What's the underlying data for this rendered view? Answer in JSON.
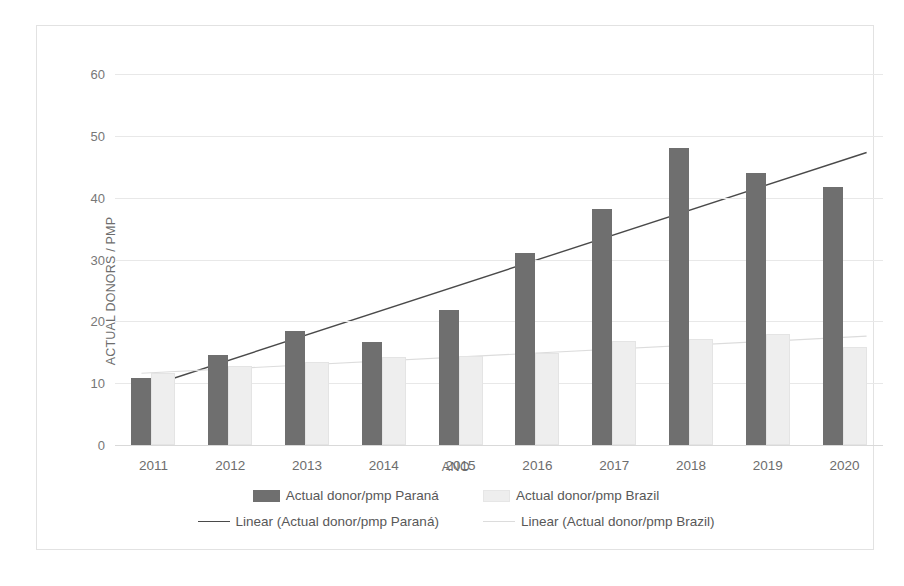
{
  "chart_data": {
    "type": "bar",
    "title": "",
    "xlabel": "ANO",
    "ylabel": "ACTUAL DONORS / PMP",
    "categories": [
      "2011",
      "2012",
      "2013",
      "2014",
      "2015",
      "2016",
      "2017",
      "2018",
      "2019",
      "2020"
    ],
    "ylim": [
      0,
      60
    ],
    "yticks": [
      0,
      10,
      20,
      30,
      40,
      50,
      60
    ],
    "grid": true,
    "legend_position": "bottom",
    "series": [
      {
        "name": "Actual donor/pmp Paraná",
        "type": "bar",
        "color": "#6f6f6f",
        "values": [
          10.8,
          14.6,
          18.4,
          16.7,
          21.8,
          31.0,
          38.2,
          48.0,
          44.0,
          41.7
        ]
      },
      {
        "name": "Actual donor/pmp Brazil",
        "type": "bar",
        "color": "#eeeeee",
        "values": [
          11.6,
          12.7,
          13.4,
          14.3,
          14.4,
          14.9,
          16.8,
          17.1,
          17.9,
          15.9
        ]
      },
      {
        "name": "Linear (Actual donor/pmp Paraná)",
        "type": "trendline",
        "color": "#4a4a4a",
        "start": 9.1,
        "end": 47.3
      },
      {
        "name": "Linear (Actual donor/pmp Brazil)",
        "type": "trendline",
        "color": "#dcdcdc",
        "start": 11.6,
        "end": 17.6
      }
    ],
    "legend": [
      {
        "label": "Actual donor/pmp Paraná",
        "marker": "bar-swatch-dark"
      },
      {
        "label": "Actual donor/pmp Brazil",
        "marker": "bar-swatch-light"
      },
      {
        "label": "Linear (Actual donor/pmp Paraná)",
        "marker": "line-swatch-dark"
      },
      {
        "label": "Linear (Actual donor/pmp Brazil)",
        "marker": "line-swatch-light"
      }
    ]
  }
}
